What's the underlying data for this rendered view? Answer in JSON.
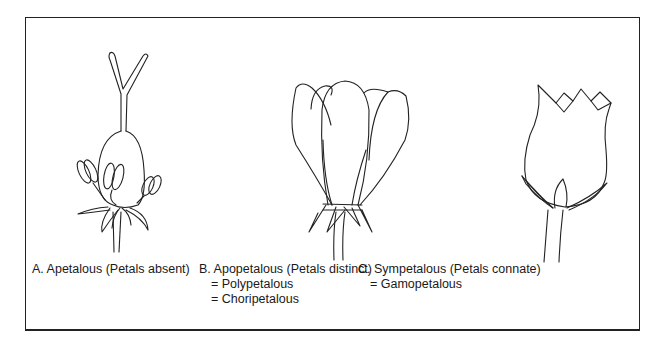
{
  "figure": {
    "panels": [
      {
        "id": "A",
        "title": "A. Apetalous (Petals absent)",
        "synonyms": []
      },
      {
        "id": "B",
        "title": "B. Apopetalous (Petals distinct)",
        "synonyms": [
          "= Polypetalous",
          "= Choripetalous"
        ]
      },
      {
        "id": "C",
        "title": "C. Sympetalous (Petals connate)",
        "synonyms": [
          "= Gamopetalous"
        ]
      }
    ],
    "colors": {
      "line": "#222222",
      "background": "#ffffff"
    }
  }
}
